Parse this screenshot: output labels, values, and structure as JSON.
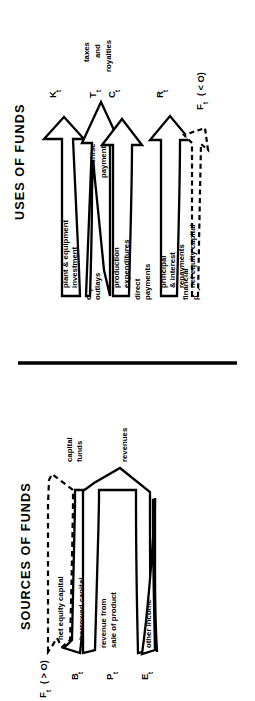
{
  "figure": {
    "orientation": "rotated-90-ccw",
    "divider": {
      "name": "horizontal-rule"
    },
    "panels": [
      {
        "id": "uses",
        "title": "USES OF FUNDS",
        "arrows": [
          {
            "id": "capital-outlays",
            "outer_label": "capital\noutlays",
            "outer_label_lines": [
              "capital",
              "outlays"
            ],
            "inner_label_lines": [
              "plant & equipment",
              "investment"
            ],
            "symbol": "K",
            "symbol_sub": "t",
            "symbol_note": "",
            "style": "solid"
          },
          {
            "id": "franchise-payments",
            "outer_label_lines": [],
            "inner_label_lines": [
              "franchise",
              "payments"
            ],
            "symbol": "T",
            "symbol_sub": "t",
            "symbol_note": "",
            "tip_label_lines": [
              "taxes",
              "and",
              "royalties"
            ],
            "style": "solid"
          },
          {
            "id": "direct-payments",
            "outer_label_lines": [
              "direct",
              "payments"
            ],
            "inner_label_lines": [
              "production",
              "expenditures"
            ],
            "symbol": "C",
            "symbol_sub": "t",
            "symbol_note": "",
            "style": "solid"
          },
          {
            "id": "financial-payments",
            "outer_label_lines": [
              "financial",
              "payments"
            ],
            "inner_label_lines": [
              "principal",
              "& interest",
              "repayments"
            ],
            "symbol": "R",
            "symbol_sub": "t",
            "symbol_note": "",
            "style": "solid"
          },
          {
            "id": "net-equity-capital-out",
            "outer_label_lines": [],
            "inner_label_lines": [
              "net equity capital"
            ],
            "symbol": "F",
            "symbol_sub": "t",
            "symbol_note": "( < O)",
            "style": "dashed"
          }
        ]
      },
      {
        "id": "sources",
        "title": "SOURCES OF FUNDS",
        "arrows": [
          {
            "id": "net-equity-capital-in",
            "inner_label_lines": [
              "net equity capital"
            ],
            "tip_label_lines": [
              "capital",
              "funds"
            ],
            "symbol": "F",
            "symbol_sub": "t",
            "symbol_note": "( > O)",
            "style": "dashed"
          },
          {
            "id": "borrowed-capital",
            "inner_label_lines": [
              "borrowed capital"
            ],
            "tip_label_lines": [],
            "symbol": "B",
            "symbol_sub": "t",
            "symbol_note": "",
            "style": "solid"
          },
          {
            "id": "revenue-sale-of-product",
            "inner_label_lines": [
              "revenue from",
              "sale of product"
            ],
            "tip_label_lines": [
              "revenues"
            ],
            "symbol": "P",
            "symbol_sub": "t",
            "symbol_note": "",
            "style": "solid"
          },
          {
            "id": "other-income",
            "inner_label_lines": [
              "other income"
            ],
            "tip_label_lines": [],
            "symbol": "E",
            "symbol_sub": "t",
            "symbol_note": "",
            "style": "solid"
          }
        ]
      }
    ]
  },
  "colors": {
    "ink": "#000000",
    "paper": "#ffffff"
  }
}
